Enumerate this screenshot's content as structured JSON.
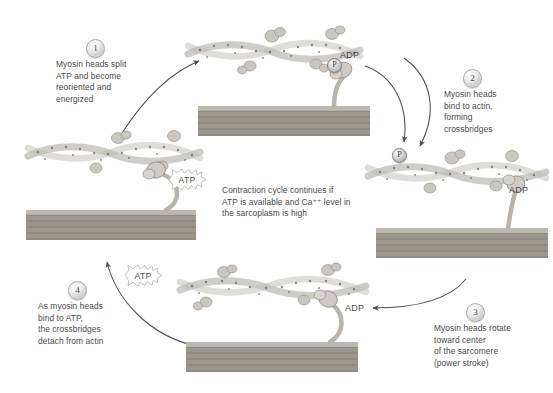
{
  "diagram": {
    "center_note": {
      "line1": "Contraction cycle continues if",
      "line2": "ATP is available and Ca⁺⁺ level in",
      "line3": "the sarcoplasm is high"
    },
    "steps": [
      {
        "number": "1",
        "lines": [
          "Myosin heads split",
          "ATP and become",
          "reoriented and",
          "energized"
        ]
      },
      {
        "number": "2",
        "lines": [
          "Myosin heads",
          "bind to actin,",
          "forming",
          "crossbridges"
        ]
      },
      {
        "number": "3",
        "lines": [
          "Myosin heads rotate",
          "toward center",
          "of the sarcomere",
          "(power stroke)"
        ]
      },
      {
        "number": "4",
        "lines": [
          "As myosin heads",
          "bind to ATP,",
          "the crossbridges",
          "detach from actin"
        ]
      }
    ],
    "molecules": {
      "adp_top": "ADP",
      "adp_right": "ADP",
      "adp_bottom": "ADP",
      "phosphate_top": "P",
      "phosphate_released": "P",
      "atp_left": "ATP",
      "atp_lower": "ATP"
    },
    "colors": {
      "actin_fill": "#e9e7e2",
      "actin_stroke": "#9a968f",
      "myosin_fill": "#cfcbc4",
      "myosin_stroke": "#8e8a83",
      "thick_filament": "#9b968e",
      "arrow": "#4d4d4d",
      "text": "#4b4b4b",
      "background": "#ffffff"
    }
  }
}
